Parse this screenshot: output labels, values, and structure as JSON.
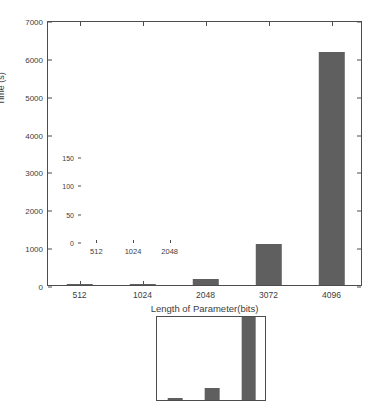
{
  "chart_data": {
    "type": "bar",
    "title": "",
    "xlabel": "Length of Parameter(bits)",
    "ylabel": "Time (s)",
    "categories": [
      "512",
      "1024",
      "2048",
      "3072",
      "4096"
    ],
    "values": [
      1,
      10,
      150,
      1085,
      6155
    ],
    "ylim": [
      0,
      7000
    ],
    "yticks": [
      0,
      1000,
      2000,
      3000,
      4000,
      5000,
      6000,
      7000
    ],
    "ytick_labels": [
      "0",
      "1000",
      "2000",
      "3000",
      "4000",
      "5000",
      "6000",
      "7000"
    ],
    "grid": false,
    "legend": null,
    "bar_color": "#5f5f5f",
    "axis_color": "#4d4d4d",
    "background": "#ffffff",
    "inset": {
      "type": "bar",
      "categories": [
        "512",
        "1024",
        "2048"
      ],
      "values": [
        3,
        22,
        150
      ],
      "ylim": [
        0,
        150
      ],
      "yticks": [
        0,
        50,
        100,
        150
      ],
      "ytick_labels": [
        "0",
        "50",
        "100",
        "150"
      ],
      "xlabel": "",
      "ylabel": "",
      "note": "2048 bar reaches top of inset axis (clipped)"
    }
  }
}
